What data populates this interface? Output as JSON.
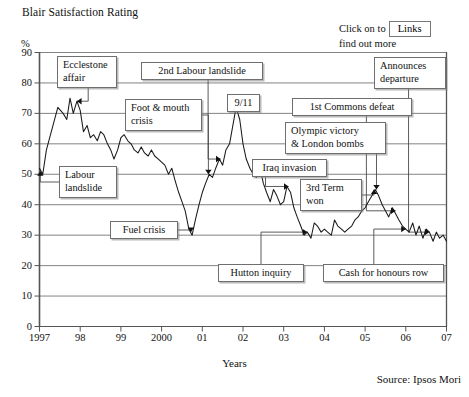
{
  "header": {
    "title": "Blair Satisfaction Rating",
    "percent_symbol": "%",
    "links_hint_line1": "Click on to",
    "links_hint_line2": "find out more",
    "links_button_label": "Links"
  },
  "footer": {
    "source": "Source: Ipsos Mori",
    "xaxis_title": "Years"
  },
  "chart_data": {
    "type": "line",
    "title": "Blair Satisfaction Rating",
    "xlabel": "Years",
    "ylabel": "%",
    "ylim": [
      0,
      90
    ],
    "xlim": [
      1997,
      2007
    ],
    "grid": true,
    "legend": "none",
    "yticks": [
      0,
      10,
      20,
      30,
      40,
      50,
      60,
      70,
      80,
      90
    ],
    "xticks": [
      "1997",
      "98",
      "99",
      "2000",
      "01",
      "02",
      "03",
      "04",
      "05",
      "06",
      "07"
    ],
    "series": [
      {
        "name": "Blair satisfaction rating",
        "x": [
          1997.0,
          1997.08,
          1997.17,
          1997.33,
          1997.45,
          1997.58,
          1997.67,
          1997.75,
          1997.83,
          1997.92,
          1998.0,
          1998.08,
          1998.17,
          1998.25,
          1998.33,
          1998.42,
          1998.5,
          1998.58,
          1998.67,
          1998.75,
          1998.83,
          1998.92,
          1999.0,
          1999.08,
          1999.17,
          1999.25,
          1999.33,
          1999.42,
          1999.5,
          1999.58,
          1999.67,
          1999.75,
          1999.83,
          1999.92,
          2000.0,
          2000.08,
          2000.17,
          2000.25,
          2000.33,
          2000.42,
          2000.5,
          2000.58,
          2000.67,
          2000.75,
          2000.83,
          2000.92,
          2001.0,
          2001.08,
          2001.17,
          2001.25,
          2001.33,
          2001.42,
          2001.5,
          2001.58,
          2001.67,
          2001.75,
          2001.83,
          2001.92,
          2002.0,
          2002.08,
          2002.17,
          2002.25,
          2002.33,
          2002.42,
          2002.5,
          2002.58,
          2002.67,
          2002.75,
          2002.83,
          2002.92,
          2003.0,
          2003.08,
          2003.17,
          2003.25,
          2003.33,
          2003.42,
          2003.5,
          2003.58,
          2003.67,
          2003.75,
          2003.83,
          2003.92,
          2004.0,
          2004.08,
          2004.17,
          2004.25,
          2004.33,
          2004.42,
          2004.5,
          2004.58,
          2004.67,
          2004.75,
          2004.83,
          2004.92,
          2005.0,
          2005.08,
          2005.17,
          2005.25,
          2005.33,
          2005.42,
          2005.5,
          2005.58,
          2005.67,
          2005.75,
          2005.83,
          2005.92,
          2006.0,
          2006.08,
          2006.17,
          2006.25,
          2006.33,
          2006.42,
          2006.5,
          2006.58,
          2006.67,
          2006.75,
          2006.83,
          2006.92,
          2007.0
        ],
        "y": [
          52,
          50,
          58,
          66,
          72,
          70,
          68,
          75,
          70,
          74,
          71,
          64,
          66,
          62,
          63,
          61,
          64,
          63,
          60,
          58,
          55,
          58,
          62,
          63,
          61,
          60,
          58,
          57,
          59,
          57,
          56,
          58,
          56,
          55,
          54,
          53,
          50,
          52,
          48,
          44,
          41,
          38,
          32,
          30,
          35,
          40,
          44,
          47,
          50,
          49,
          52,
          55,
          53,
          58,
          60,
          66,
          72,
          68,
          60,
          55,
          52,
          50,
          49,
          52,
          47,
          44,
          41,
          45,
          43,
          40,
          41,
          46,
          44,
          39,
          36,
          33,
          30,
          31,
          29,
          34,
          33,
          31,
          32,
          31,
          30,
          35,
          33,
          32,
          31,
          32,
          33,
          35,
          36,
          38,
          39,
          41,
          43,
          45,
          43,
          40,
          38,
          36,
          39,
          37,
          35,
          33,
          32,
          31,
          34,
          30,
          33,
          29,
          32,
          31,
          28,
          31,
          29,
          30,
          28
        ]
      }
    ],
    "annotations": [
      {
        "label": "Ecclestone\naffair",
        "target_year": 1997.92,
        "target_value": 74
      },
      {
        "label": "Labour\nlandslide",
        "target_year": 1997.02,
        "target_value": 51
      },
      {
        "label": "Foot & mouth\ncrisis",
        "target_year": 2001.15,
        "target_value": 50
      },
      {
        "label": "2nd Labour landslide",
        "target_year": 2001.45,
        "target_value": 55
      },
      {
        "label": "9/11",
        "target_year": 2001.83,
        "target_value": 72
      },
      {
        "label": "Fuel crisis",
        "target_year": 2000.72,
        "target_value": 31
      },
      {
        "label": "Iraq invasion",
        "target_year": 2003.12,
        "target_value": 46
      },
      {
        "label": "1st Commons defeat",
        "target_year": 2005.75,
        "target_value": 38
      },
      {
        "label": "Olympic victory\n& London bombs",
        "target_year": 2005.28,
        "target_value": 45
      },
      {
        "label": "3rd Term\nwon",
        "target_year": 2005.22,
        "target_value": 45
      },
      {
        "label": "Hutton inquiry",
        "target_year": 2003.58,
        "target_value": 31
      },
      {
        "label": "Cash for honours row",
        "target_year": 2006.0,
        "target_value": 32
      },
      {
        "label": "Announces\ndeparture",
        "target_year": 2006.58,
        "target_value": 31
      }
    ]
  },
  "callouts": [
    {
      "id": "ecclestone-affair",
      "text": "Ecclestone\naffair",
      "x": 57,
      "y": 56,
      "w": 60,
      "h": 32
    },
    {
      "id": "labour-landslide",
      "text": "Labour\nlandslide",
      "x": 59,
      "y": 166,
      "w": 58,
      "h": 32
    },
    {
      "id": "foot-and-mouth-crisis",
      "text": "Foot & mouth\ncrisis",
      "x": 125,
      "y": 99,
      "w": 77,
      "h": 32
    },
    {
      "id": "second-labour-landslide",
      "text": "2nd Labour landslide",
      "x": 141,
      "y": 62,
      "w": 122,
      "h": 18
    },
    {
      "id": "nine-eleven",
      "text": "9/11",
      "x": 227,
      "y": 94,
      "w": 33,
      "h": 18
    },
    {
      "id": "fuel-crisis",
      "text": "Fuel crisis",
      "x": 110,
      "y": 221,
      "w": 68,
      "h": 18
    },
    {
      "id": "iraq-invasion",
      "text": "Iraq invasion",
      "x": 252,
      "y": 159,
      "w": 75,
      "h": 18
    },
    {
      "id": "first-commons-defeat",
      "text": "1st Commons defeat",
      "x": 292,
      "y": 98,
      "w": 120,
      "h": 18
    },
    {
      "id": "olympic-victory-london-bombs",
      "text": "Olympic victory\n& London bombs",
      "x": 285,
      "y": 122,
      "w": 101,
      "h": 32
    },
    {
      "id": "third-term-won",
      "text": "3rd Term\nwon",
      "x": 300,
      "y": 179,
      "w": 62,
      "h": 32
    },
    {
      "id": "hutton-inquiry",
      "text": "Hutton inquiry",
      "x": 218,
      "y": 264,
      "w": 86,
      "h": 18
    },
    {
      "id": "cash-for-honours-row",
      "text": "Cash for honours row",
      "x": 323,
      "y": 264,
      "w": 121,
      "h": 18
    },
    {
      "id": "announces-departure",
      "text": "Announces\ndeparture",
      "x": 374,
      "y": 57,
      "w": 72,
      "h": 32
    }
  ]
}
